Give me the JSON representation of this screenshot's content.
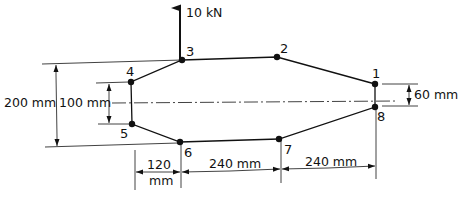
{
  "diagram": {
    "type": "structural-truss-cross-section",
    "load": {
      "label": "10 kN",
      "direction": "up",
      "applied_at_node": "3"
    },
    "nodes": [
      {
        "id": "1",
        "x": 375,
        "y": 84
      },
      {
        "id": "2",
        "x": 277,
        "y": 57
      },
      {
        "id": "3",
        "x": 182,
        "y": 60
      },
      {
        "id": "4",
        "x": 131,
        "y": 82
      },
      {
        "id": "5",
        "x": 132,
        "y": 124
      },
      {
        "id": "6",
        "x": 180,
        "y": 142
      },
      {
        "id": "7",
        "x": 279,
        "y": 139
      },
      {
        "id": "8",
        "x": 375,
        "y": 107
      }
    ],
    "members": [
      [
        "1",
        "2"
      ],
      [
        "2",
        "3"
      ],
      [
        "3",
        "4"
      ],
      [
        "4",
        "5"
      ],
      [
        "5",
        "6"
      ],
      [
        "6",
        "7"
      ],
      [
        "7",
        "8"
      ],
      [
        "8",
        "1"
      ]
    ],
    "dimensions": {
      "total_height": "200 mm",
      "inner_height": "100 mm",
      "right_height": "60 mm",
      "horizontal": [
        "120",
        "mm",
        "240 mm",
        "240 mm"
      ]
    },
    "node_labels": {
      "n1": "1",
      "n2": "2",
      "n3": "3",
      "n4": "4",
      "n5": "5",
      "n6": "6",
      "n7": "7",
      "n8": "8"
    },
    "dim_labels": {
      "h200": "200 mm",
      "h100": "100 mm",
      "h60": "60 mm",
      "w120_top": "120",
      "w120_bottom": "mm",
      "w240_a": "240 mm",
      "w240_b": "240 mm"
    },
    "colors": {
      "ink": "#111111",
      "background": "#ffffff"
    }
  }
}
